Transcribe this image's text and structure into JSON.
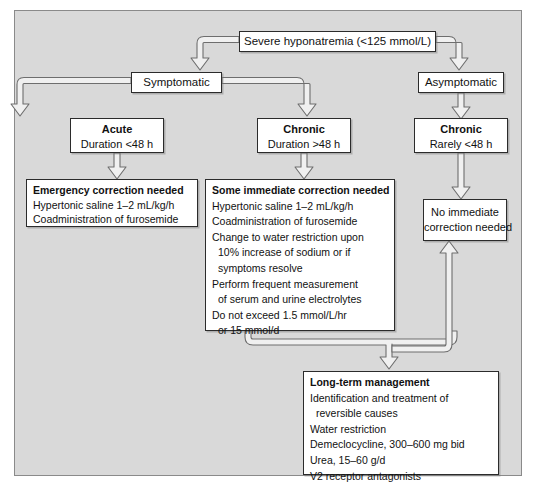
{
  "diagram": {
    "colors": {
      "panel_background": "#d9d9d9",
      "panel_border": "#8a8a8a",
      "node_background": "#ffffff",
      "node_border": "#2b2b2b",
      "connector_fill": "#f2f2f2",
      "connector_stroke": "#6e6e6e",
      "text": "#111111"
    },
    "nodes": {
      "severe": {
        "label": "Severe hyponatremia (<125 mmol/L)"
      },
      "symptomatic": {
        "label": "Symptomatic"
      },
      "asymptomatic": {
        "label": "Asymptomatic"
      },
      "acute": {
        "title": "Acute",
        "subtitle": "Duration <48 h"
      },
      "chronic_symptomatic": {
        "title": "Chronic",
        "subtitle": "Duration >48 h"
      },
      "chronic_asymptomatic": {
        "title": "Chronic",
        "subtitle": "Rarely <48 h"
      },
      "emergency_correction": {
        "title": "Emergency correction needed",
        "lines": [
          "Hypertonic saline 1–2 mL/kg/h",
          "Coadministration of furosemide"
        ]
      },
      "some_immediate_correction": {
        "title": "Some immediate correction needed",
        "lines": [
          "Hypertonic saline 1–2 mL/kg/h",
          "Coadministration of furosemide",
          "Change to water restriction upon",
          "10% increase of sodium or if",
          "symptoms resolve",
          "Perform frequent measurement",
          "of serum and urine electrolytes",
          "Do not exceed 1.5 mmol/L/hr",
          "or 15 mmol/d"
        ],
        "indented_lines": [
          3,
          4,
          6,
          8
        ]
      },
      "no_immediate_correction": {
        "line1": "No immediate",
        "line2": "correction needed"
      },
      "long_term_management": {
        "title": "Long-term management",
        "lines": [
          "Identification and treatment of",
          "reversible causes",
          "Water restriction",
          "Demeclocycline, 300–600 mg bid",
          "Urea, 15–60 g/d",
          "V2 receptor antagonists"
        ],
        "indented_lines": [
          1
        ]
      }
    },
    "connectors": [
      {
        "name": "severe-to-symptomatic",
        "direction": "down"
      },
      {
        "name": "severe-to-asymptomatic",
        "direction": "down"
      },
      {
        "name": "symptomatic-to-acute",
        "direction": "down"
      },
      {
        "name": "symptomatic-to-chronic",
        "direction": "down"
      },
      {
        "name": "acute-to-emergency",
        "direction": "down"
      },
      {
        "name": "chronic-to-some-immediate",
        "direction": "down"
      },
      {
        "name": "asymptomatic-to-chronic-asym",
        "direction": "down"
      },
      {
        "name": "chronic-asym-to-no-immediate",
        "direction": "down"
      },
      {
        "name": "some-immediate-to-long-term",
        "direction": "down"
      },
      {
        "name": "merge-to-no-immediate",
        "direction": "up"
      }
    ]
  }
}
